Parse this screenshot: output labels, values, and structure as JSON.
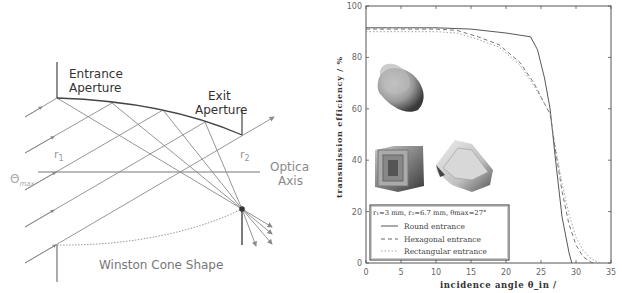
{
  "diagram": {
    "labels": {
      "entrance_line1": "Entrance",
      "entrance_line2": "Aperture",
      "exit_line1": "Exit",
      "exit_line2": "Aperture",
      "r1": "r",
      "r1_sub": "1",
      "r2": "r",
      "r2_sub": "2",
      "theta": "Θ",
      "theta_sub": "max",
      "optical_line1": "Optical",
      "optical_line2": "Axis",
      "caption": "Winston Cone Shape"
    },
    "colors": {
      "line": "#444444",
      "ray": "#8a8a8a",
      "text": "#333333",
      "muted_text": "#9a9a9a"
    }
  },
  "chart_data": {
    "type": "line",
    "title": "",
    "xlabel": "incidence angle θ_in /",
    "ylabel": "transmission efficiency / %",
    "xlim": [
      0,
      35
    ],
    "ylim": [
      0,
      100
    ],
    "xticks": [
      0,
      5,
      10,
      15,
      20,
      25,
      30,
      35
    ],
    "yticks": [
      0,
      20,
      40,
      60,
      80,
      100
    ],
    "grid": false,
    "legend_position": "lower-left",
    "legend_title": "r₁=3 mm, r₂=6.7 mm, θmax=27°",
    "series": [
      {
        "name": "Round entrance",
        "style": "solid",
        "x": [
          0,
          5,
          10,
          15,
          20,
          23.5,
          24.5,
          25.5,
          26.3,
          27,
          28,
          29,
          29.4
        ],
        "y": [
          91.5,
          91.5,
          91.5,
          91,
          89.5,
          88,
          83,
          72,
          60,
          42,
          18,
          4,
          0
        ]
      },
      {
        "name": "Hexagonal entrance",
        "style": "dashed",
        "x": [
          0,
          5,
          10,
          13,
          16,
          19,
          22,
          24,
          25.5,
          26.3,
          27,
          28,
          29,
          30,
          31,
          32,
          32.5
        ],
        "y": [
          91,
          91,
          91,
          90.5,
          88,
          85,
          78,
          70,
          62,
          58,
          45,
          28,
          15,
          7,
          2.5,
          0.5,
          0
        ]
      },
      {
        "name": "Rectangular entrance",
        "style": "dotted",
        "x": [
          0,
          5,
          10,
          13,
          16,
          19,
          22,
          24,
          25.5,
          26.3,
          27,
          28,
          29,
          30,
          31,
          32,
          33,
          33.5
        ],
        "y": [
          90,
          90,
          90,
          89.5,
          87,
          84,
          77,
          69,
          62,
          58,
          46,
          31,
          19,
          10,
          5,
          2,
          0.5,
          0
        ]
      }
    ],
    "x_ticklabels": [
      "0",
      "5",
      "10",
      "15",
      "20",
      "25",
      "30",
      "35"
    ],
    "y_ticklabels": [
      "0",
      "20",
      "40",
      "60",
      "80",
      "100"
    ],
    "legend_entries": [
      "Round entrance",
      "Hexagonal entrance",
      "Rectangular entrance"
    ],
    "insets": [
      "round-cone-render",
      "rectangular-cone-render",
      "hexagonal-cone-render"
    ]
  }
}
